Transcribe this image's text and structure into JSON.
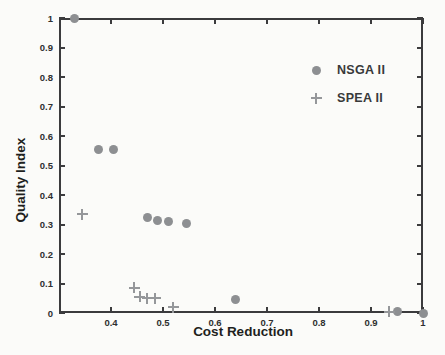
{
  "figure": {
    "background_color": "#fbfbf9",
    "axis_color": "#3b3b3d",
    "text_color": "#1e1f20"
  },
  "chart_data": {
    "type": "scatter",
    "title": "",
    "xlabel": "Cost Reduction",
    "ylabel": "Quality Index",
    "xlim": [
      0.3,
      1.0
    ],
    "ylim": [
      0,
      1.0
    ],
    "grid": false,
    "legend_position": "inside-upper-right-no-box",
    "x_ticks": [
      0.4,
      0.5,
      0.6,
      0.7,
      0.8,
      0.9,
      1
    ],
    "x_tick_labels": [
      "0.4",
      "0.5",
      "0.6",
      "0.7",
      "0.8",
      "0.9",
      "1"
    ],
    "y_ticks": [
      0,
      0.1,
      0.2,
      0.3,
      0.4,
      0.5,
      0.6,
      0.7,
      0.8,
      0.9,
      1
    ],
    "y_tick_labels": [
      "0",
      "0.1",
      "0.2",
      "0.3",
      "0.4",
      "0.5",
      "0.6",
      "0.7",
      "0.8",
      "0.9",
      "1"
    ],
    "series": [
      {
        "name": "NSGA II",
        "marker": "circle",
        "color": "#8d8f92",
        "points": [
          [
            0.33,
            1.0
          ],
          [
            0.375,
            0.555
          ],
          [
            0.405,
            0.555
          ],
          [
            0.47,
            0.325
          ],
          [
            0.49,
            0.315
          ],
          [
            0.51,
            0.31
          ],
          [
            0.545,
            0.305
          ],
          [
            0.64,
            0.045
          ],
          [
            0.95,
            0.005
          ],
          [
            1.0,
            0.0
          ]
        ]
      },
      {
        "name": "SPEA II",
        "marker": "plus",
        "color": "#95979a",
        "points": [
          [
            0.345,
            0.335
          ],
          [
            0.445,
            0.085
          ],
          [
            0.455,
            0.055
          ],
          [
            0.47,
            0.05
          ],
          [
            0.485,
            0.05
          ],
          [
            0.52,
            0.02
          ],
          [
            0.935,
            0.005
          ]
        ]
      }
    ]
  }
}
